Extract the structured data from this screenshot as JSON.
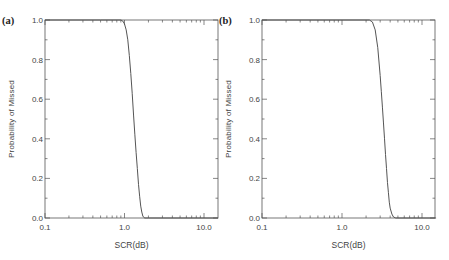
{
  "chart_data": [
    {
      "type": "line",
      "panel_label": "(a)",
      "title": "",
      "xlabel": "SCR(dB)",
      "ylabel": "Probability of Missed",
      "xscale": "log",
      "xlim": [
        0.1,
        15
      ],
      "ylim": [
        0.0,
        1.0
      ],
      "x_ticks": [
        "0.1",
        "1.0",
        "10.0"
      ],
      "y_ticks": [
        "0.0",
        "0.2",
        "0.4",
        "0.6",
        "0.8",
        "1.0"
      ],
      "grid": false,
      "legend": null,
      "series": [
        {
          "name": "Pm",
          "x": [
            0.1,
            0.5,
            0.9,
            0.95,
            1.0,
            1.05,
            1.1,
            1.15,
            1.2,
            1.25,
            1.3,
            1.35,
            1.4,
            1.45,
            1.5,
            1.55,
            1.6,
            1.65,
            1.7,
            1.75,
            1.8,
            2.0,
            5.0,
            15.0
          ],
          "y": [
            1.0,
            1.0,
            1.0,
            0.995,
            0.98,
            0.95,
            0.9,
            0.82,
            0.73,
            0.63,
            0.52,
            0.42,
            0.33,
            0.25,
            0.17,
            0.11,
            0.06,
            0.03,
            0.01,
            0.003,
            0.0,
            0.0,
            0.0,
            0.0
          ]
        }
      ]
    },
    {
      "type": "line",
      "panel_label": "(b)",
      "title": "",
      "xlabel": "SCR(dB)",
      "ylabel": "Probability of Missed",
      "xscale": "log",
      "xlim": [
        0.1,
        15
      ],
      "ylim": [
        0.0,
        1.0
      ],
      "x_ticks": [
        "0.1",
        "1.0",
        "10.0"
      ],
      "y_ticks": [
        "0.0",
        "0.2",
        "0.4",
        "0.6",
        "0.8",
        "1.0"
      ],
      "grid": false,
      "legend": null,
      "series": [
        {
          "name": "Pm",
          "x": [
            0.1,
            1.0,
            2.2,
            2.4,
            2.6,
            2.8,
            3.0,
            3.1,
            3.2,
            3.3,
            3.4,
            3.5,
            3.6,
            3.7,
            3.8,
            3.9,
            4.0,
            4.2,
            4.4,
            4.7,
            5.0,
            10.0,
            15.0
          ],
          "y": [
            1.0,
            1.0,
            1.0,
            0.99,
            0.95,
            0.86,
            0.72,
            0.64,
            0.56,
            0.48,
            0.4,
            0.32,
            0.25,
            0.18,
            0.13,
            0.08,
            0.05,
            0.02,
            0.005,
            0.0,
            0.0,
            0.0,
            0.0
          ]
        }
      ]
    }
  ]
}
